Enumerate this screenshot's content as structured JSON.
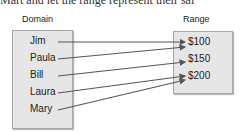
{
  "top_text": "Mart and let the range represent their sal",
  "domain": {
    "title": "Domain",
    "items": [
      "Jim",
      "Paula",
      "Bill",
      "Laura",
      "Mary"
    ]
  },
  "range": {
    "title": "Range",
    "items": [
      "$100",
      "$150",
      "$200"
    ]
  },
  "mappings": [
    {
      "from": "Jim",
      "to": "$100"
    },
    {
      "from": "Paula",
      "to": "$100"
    },
    {
      "from": "Bill",
      "to": "$150"
    },
    {
      "from": "Laura",
      "to": "$200"
    },
    {
      "from": "Mary",
      "to": "$200"
    }
  ],
  "colors": {
    "box_fill": "#e6e6e6",
    "box_border": "#a6a6a6",
    "arrow": "#555555"
  }
}
